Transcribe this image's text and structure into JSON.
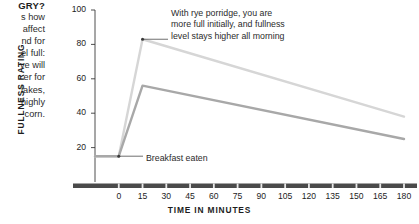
{
  "body_copy": {
    "heading": "GRY?",
    "lines": [
      "s how",
      "affect",
      "nd for",
      "el full:",
      "ve will",
      "er for",
      "lakes,",
      "highly",
      "corn."
    ]
  },
  "annotations": {
    "rye": [
      "With rye porridge, you are",
      "more full initially, and fullness",
      "level stays higher all morning"
    ],
    "breakfast": "Breakfast eaten"
  },
  "chart_data": {
    "type": "line",
    "title": "",
    "xlabel": "TIME IN MINUTES",
    "ylabel": "FULLNESS RATING",
    "xlim": [
      -15,
      180
    ],
    "ylim": [
      0,
      100
    ],
    "xticks": [
      0,
      15,
      30,
      45,
      60,
      75,
      90,
      105,
      120,
      135,
      150,
      165,
      180
    ],
    "yticks": [
      20,
      40,
      60,
      80,
      100
    ],
    "grid": false,
    "legend": "none",
    "x": [
      -15,
      0,
      15,
      180
    ],
    "series": [
      {
        "name": "Rye porridge",
        "color": "#d6d6d6",
        "values": [
          15,
          15,
          83,
          38
        ]
      },
      {
        "name": "Cornflakes",
        "color": "#a8a8a8",
        "values": [
          15,
          15,
          56,
          25
        ]
      }
    ],
    "markers": [
      {
        "label": "rye-peak",
        "x": 15,
        "y": 83
      },
      {
        "label": "breakfast",
        "x": 0,
        "y": 15
      }
    ],
    "axis_color": "#3a3a3a",
    "baseline_color": "#4a4a4a"
  }
}
